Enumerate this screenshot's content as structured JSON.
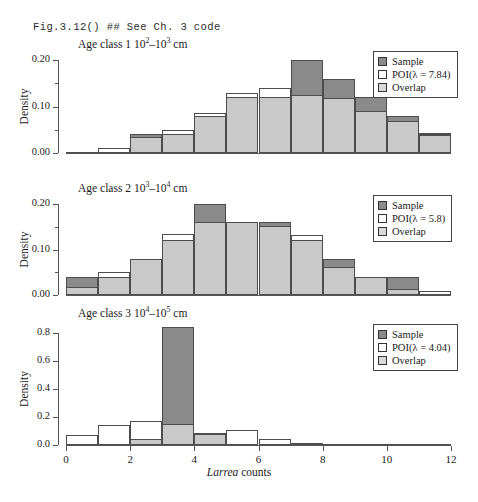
{
  "header": {
    "code_text": "Fig.3.12() ## See Ch. 3 code"
  },
  "axis": {
    "xlabel_italic": "Larrea",
    "xlabel_rest": " counts",
    "ylabel": "Density",
    "xticks": [
      "0",
      "2",
      "4",
      "6",
      "8",
      "10",
      "12"
    ],
    "xlim": [
      0,
      12
    ]
  },
  "colors": {
    "sample": "#8a8a8a",
    "poi": "#ffffff",
    "overlap": "#c9c9c9",
    "axis": "#555555",
    "outline": "#4d4d4d"
  },
  "chart_data": [
    {
      "type": "bar",
      "title_prefix": "Age class 1  10",
      "title_sup1": "2",
      "title_mid": "–10",
      "title_sup2": "3",
      "title_suffix": " cm",
      "ylabel": "Density",
      "xlabel": "Larrea counts",
      "ylim": [
        0,
        0.2
      ],
      "yticks": [
        "0.00",
        "0.10",
        "0.20"
      ],
      "ytick_values": [
        0.0,
        0.1,
        0.2
      ],
      "yminor_values": [
        0.05,
        0.15
      ],
      "grid": false,
      "legend_position": "top-right",
      "legend": [
        {
          "label": "Sample",
          "swatch": "sample"
        },
        {
          "label": "POI(λ = 7.84)",
          "swatch": "poi"
        },
        {
          "label": "Overlap",
          "swatch": "overlap"
        }
      ],
      "bin_edges": [
        0,
        1,
        2,
        3,
        4,
        5,
        6,
        7,
        8,
        9,
        10,
        11,
        12
      ],
      "series": [
        {
          "name": "Sample",
          "values": [
            0.0,
            0.0,
            0.04,
            0.04,
            0.08,
            0.12,
            0.12,
            0.2,
            0.16,
            0.12,
            0.08,
            0.04
          ]
        },
        {
          "name": "POI",
          "values": [
            0.003,
            0.01,
            0.04,
            0.05,
            0.085,
            0.13,
            0.14,
            0.13,
            0.118,
            0.09,
            0.07,
            0.042
          ]
        },
        {
          "name": "Overlap",
          "values": [
            0.0,
            0.0,
            0.035,
            0.04,
            0.08,
            0.12,
            0.12,
            0.125,
            0.118,
            0.09,
            0.068,
            0.038
          ]
        }
      ]
    },
    {
      "type": "bar",
      "title_prefix": "Age class 2  10",
      "title_sup1": "3",
      "title_mid": "–10",
      "title_sup2": "4",
      "title_suffix": " cm",
      "ylabel": "Density",
      "xlabel": "Larrea counts",
      "ylim": [
        0,
        0.2
      ],
      "yticks": [
        "0.00",
        "0.10",
        "0.20"
      ],
      "ytick_values": [
        0.0,
        0.1,
        0.2
      ],
      "yminor_values": [
        0.05,
        0.15
      ],
      "grid": false,
      "legend_position": "top-right",
      "legend": [
        {
          "label": "Sample",
          "swatch": "sample"
        },
        {
          "label": "POI(λ = 5.8)",
          "swatch": "poi"
        },
        {
          "label": "Overlap",
          "swatch": "overlap"
        }
      ],
      "bin_edges": [
        0,
        1,
        2,
        3,
        4,
        5,
        6,
        7,
        8,
        9,
        10,
        11,
        12
      ],
      "series": [
        {
          "name": "Sample",
          "values": [
            0.04,
            0.04,
            0.08,
            0.12,
            0.2,
            0.16,
            0.16,
            0.12,
            0.08,
            0.04,
            0.04,
            0.0
          ]
        },
        {
          "name": "POI",
          "values": [
            0.018,
            0.05,
            0.08,
            0.135,
            0.16,
            0.16,
            0.152,
            0.132,
            0.062,
            0.04,
            0.014,
            0.008
          ]
        },
        {
          "name": "Overlap",
          "values": [
            0.018,
            0.04,
            0.08,
            0.12,
            0.16,
            0.16,
            0.152,
            0.12,
            0.062,
            0.04,
            0.014,
            0.0
          ]
        }
      ]
    },
    {
      "type": "bar",
      "title_prefix": "Age class 3  10",
      "title_sup1": "4",
      "title_mid": "–10",
      "title_sup2": "5",
      "title_suffix": " cm",
      "ylabel": "Density",
      "xlabel": "Larrea counts",
      "ylim": [
        0,
        0.8
      ],
      "yticks": [
        "0.0",
        "0.2",
        "0.4",
        "0.6",
        "0.8"
      ],
      "ytick_values": [
        0.0,
        0.2,
        0.4,
        0.6,
        0.8
      ],
      "yminor_values": [],
      "grid": false,
      "legend_position": "top-right",
      "legend": [
        {
          "label": "Sample",
          "swatch": "sample"
        },
        {
          "label": "POI(λ = 4.04)",
          "swatch": "poi"
        },
        {
          "label": "Overlap",
          "swatch": "overlap"
        }
      ],
      "bin_edges": [
        0,
        1,
        2,
        3,
        4,
        5,
        6,
        7,
        8,
        9,
        10,
        11,
        12
      ],
      "series": [
        {
          "name": "Sample",
          "values": [
            0.0,
            0.0,
            0.04,
            0.84,
            0.08,
            0.0,
            0.0,
            0.0,
            0.0,
            0.0,
            0.0,
            0.0
          ]
        },
        {
          "name": "POI",
          "values": [
            0.07,
            0.14,
            0.175,
            0.15,
            0.085,
            0.105,
            0.04,
            0.016,
            0.008,
            0.004,
            0.002,
            0.001
          ]
        },
        {
          "name": "Overlap",
          "values": [
            0.0,
            0.0,
            0.04,
            0.15,
            0.08,
            0.0,
            0.0,
            0.0,
            0.0,
            0.0,
            0.0,
            0.0
          ]
        }
      ]
    }
  ]
}
